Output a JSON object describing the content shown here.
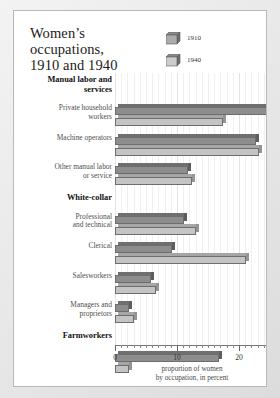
{
  "chart_data": {
    "type": "bar",
    "orientation": "horizontal",
    "title_line1": "Women’s occupations,",
    "title_line2": "1910 and 1940",
    "xlabel_line1": "proportion of women",
    "xlabel_line2": "by occupation, in percent",
    "ylabel": "",
    "xlim": [
      0,
      25
    ],
    "xticks": [
      0,
      10,
      20
    ],
    "xtick_labels": [
      "0",
      "10",
      "20"
    ],
    "grid": true,
    "legend_position": "top-right",
    "legend": [
      {
        "name": "1910",
        "color": "#8d8d8d"
      },
      {
        "name": "1940",
        "color": "#c4c4c4"
      }
    ],
    "groups": [
      {
        "label": "Manual labor and services",
        "label_line1": "Manual labor and",
        "label_line2": "services",
        "categories": [
          {
            "label_line1": "Private household",
            "label_line2": "workers",
            "values": {
              "1910": 25.8,
              "1940": 17.4
            }
          },
          {
            "label_line1": "Machine operators",
            "label_line2": "",
            "values": {
              "1910": 22.8,
              "1940": 23.2
            }
          },
          {
            "label_line1": "Other manual labor",
            "label_line2": "or service",
            "values": {
              "1910": 11.8,
              "1940": 12.4
            }
          }
        ]
      },
      {
        "label": "White-collar",
        "label_line1": "White-collar",
        "label_line2": "",
        "categories": [
          {
            "label_line1": "Professional",
            "label_line2": "and technical",
            "values": {
              "1910": 11.1,
              "1940": 13.0
            }
          },
          {
            "label_line1": "Clerical",
            "label_line2": "",
            "values": {
              "1910": 9.2,
              "1940": 21.2
            }
          },
          {
            "label_line1": "Salesworkers",
            "label_line2": "",
            "values": {
              "1910": 5.8,
              "1940": 6.6
            }
          },
          {
            "label_line1": "Managers and",
            "label_line2": "proprietors",
            "values": {
              "1910": 2.3,
              "1940": 3.1
            }
          }
        ]
      },
      {
        "label": "Farmworkers",
        "label_line1": "Farmworkers",
        "label_line2": "",
        "categories": [
          {
            "label_line1": "",
            "label_line2": "",
            "values": {
              "1910": 16.8,
              "1940": 2.2
            }
          }
        ]
      }
    ],
    "series": [
      {
        "name": "1910",
        "categories": [
          "Private household workers",
          "Machine operators",
          "Other manual labor or service",
          "Professional and technical",
          "Clerical",
          "Salesworkers",
          "Managers and proprietors",
          "Farmworkers"
        ],
        "values": [
          25.8,
          22.8,
          11.8,
          11.1,
          9.2,
          5.8,
          2.3,
          16.8
        ]
      },
      {
        "name": "1940",
        "categories": [
          "Private household workers",
          "Machine operators",
          "Other manual labor or service",
          "Professional and technical",
          "Clerical",
          "Salesworkers",
          "Managers and proprietors",
          "Farmworkers"
        ],
        "values": [
          17.4,
          23.2,
          12.4,
          13.0,
          21.2,
          6.6,
          3.1,
          2.2
        ]
      }
    ]
  }
}
